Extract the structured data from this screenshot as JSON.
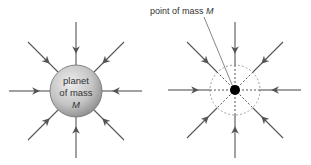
{
  "diagram": {
    "colors": {
      "arrow": "#555555",
      "planet_light": "#e6e6e6",
      "planet_dark": "#8a8a8a",
      "point_mass": "#000000",
      "dashed": "#888888",
      "text": "#333333"
    },
    "left": {
      "planet_label_line1": "planet",
      "planet_label_line2": "of mass",
      "planet_label_line3": "M",
      "arrow_count": 8
    },
    "right": {
      "point_label": "point of mass ",
      "point_label_italic": "M",
      "arrow_count": 8
    }
  }
}
